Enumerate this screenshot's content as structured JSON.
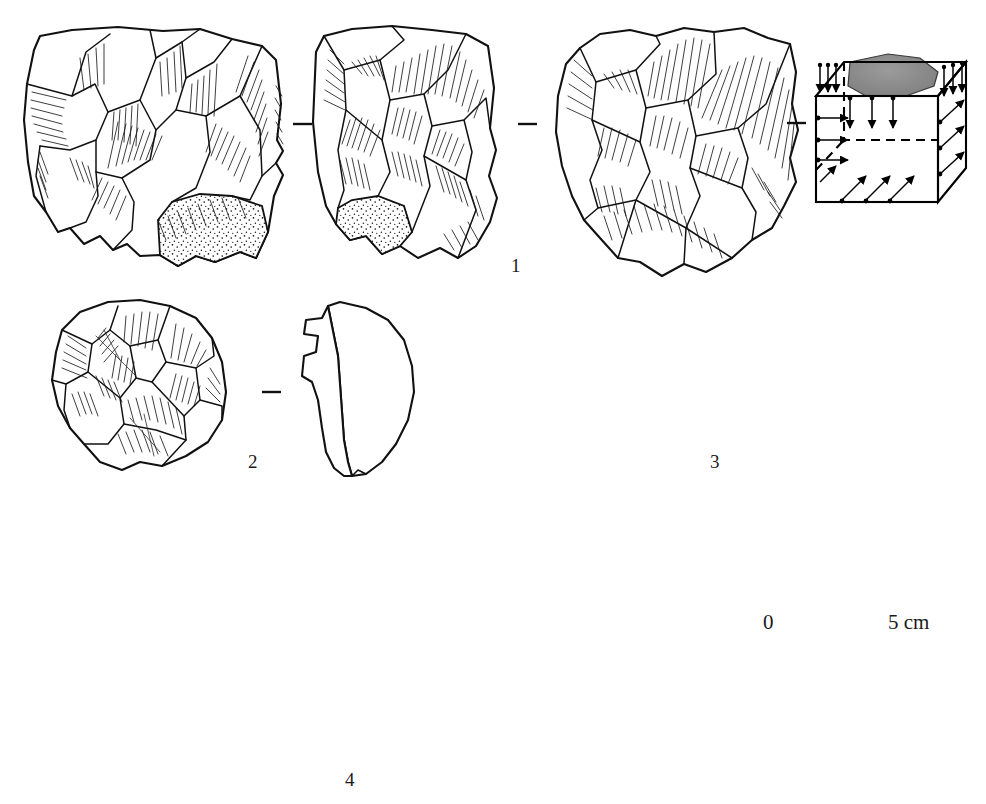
{
  "plate": {
    "kind": "archaeological-lithic-illustration-plate",
    "background_color": "#ffffff",
    "ink_color": "#111111",
    "cortex_fill": "#ffffff",
    "shaded_fill": "#8c8c8c",
    "rows": 3
  },
  "figures": [
    {
      "id": "fig1",
      "label": "1",
      "label_x": 511,
      "label_y": 256,
      "views": [
        {
          "name": "dorsal-face-view",
          "kind": "flint-core-drawing",
          "x": 20,
          "y": 18,
          "w": 275,
          "h": 262,
          "has_cortex": true,
          "cortex_position": "bottom-right"
        },
        {
          "name": "lateral-face-view",
          "kind": "flint-core-drawing",
          "x": 305,
          "y": 22,
          "w": 200,
          "h": 245,
          "has_cortex": true,
          "cortex_position": "bottom-left"
        },
        {
          "name": "ventral-face-view",
          "kind": "flint-core-drawing",
          "x": 556,
          "y": 22,
          "w": 248,
          "h": 258,
          "has_cortex": false,
          "cortex_position": ""
        },
        {
          "name": "schematic-cube-diagram",
          "kind": "cube-scheme",
          "x": 810,
          "y": 48,
          "w": 168,
          "h": 158,
          "shaded_patch": true
        }
      ],
      "separators": [
        {
          "name": "view-separator-dash",
          "x": 293,
          "y": 124,
          "len": 19
        },
        {
          "name": "view-separator-dash",
          "x": 518,
          "y": 124,
          "len": 19
        },
        {
          "name": "view-separator-dash",
          "x": 787,
          "y": 123,
          "len": 19
        }
      ]
    },
    {
      "id": "fig2",
      "label": "2",
      "label_x": 248,
      "label_y": 462,
      "views": [
        {
          "name": "dorsal-face-view",
          "kind": "flint-core-drawing",
          "x": 48,
          "y": 298,
          "w": 200,
          "h": 175,
          "has_cortex": false,
          "cortex_position": ""
        },
        {
          "name": "section-profile-view",
          "kind": "profile-outline",
          "x": 305,
          "y": 300,
          "w": 120,
          "h": 178,
          "has_cortex": false,
          "cortex_position": ""
        }
      ],
      "separators": [
        {
          "name": "view-separator-dash",
          "x": 262,
          "y": 392,
          "len": 19
        }
      ]
    },
    {
      "id": "fig3",
      "label": "3",
      "label_x": 710,
      "label_y": 462,
      "views": [
        {
          "name": "dorsal-face-view",
          "kind": "flint-core-drawing",
          "x": 480,
          "y": 300,
          "w": 190,
          "h": 170,
          "has_cortex": false,
          "cortex_position": ""
        },
        {
          "name": "hatched-section-view",
          "kind": "hatched-section",
          "x": 680,
          "y": 300,
          "w": 70,
          "h": 168,
          "has_cortex": false,
          "cortex_position": ""
        },
        {
          "name": "ventral-cortex-view",
          "kind": "flint-core-drawing",
          "x": 782,
          "y": 298,
          "w": 178,
          "h": 160,
          "has_cortex": true,
          "cortex_position": "full-face"
        }
      ],
      "separators": [
        {
          "name": "view-separator-dash",
          "x": 660,
          "y": 380,
          "len": 19
        },
        {
          "name": "view-separator-dash",
          "x": 762,
          "y": 380,
          "len": 19
        }
      ]
    },
    {
      "id": "fig4",
      "label": "4",
      "label_x": 345,
      "label_y": 773,
      "views": [
        {
          "name": "dorsal-face-view",
          "kind": "flint-core-drawing",
          "x": 48,
          "y": 505,
          "w": 272,
          "h": 262,
          "has_cortex": true,
          "cortex_position": "left"
        },
        {
          "name": "lateral-face-view",
          "kind": "flint-core-drawing",
          "x": 372,
          "y": 500,
          "w": 172,
          "h": 272,
          "has_cortex": true,
          "cortex_position": "right"
        },
        {
          "name": "schematic-cube-diagram",
          "kind": "cube-scheme",
          "x": 562,
          "y": 534,
          "w": 182,
          "h": 166,
          "shaded_patch": false
        }
      ],
      "separators": [
        {
          "name": "view-separator-dash",
          "x": 326,
          "y": 626,
          "len": 19
        },
        {
          "name": "view-separator-dash",
          "x": 536,
          "y": 626,
          "len": 19
        }
      ]
    }
  ],
  "scale": {
    "name": "scale-bar",
    "start_label": "0",
    "end_label": "5 cm",
    "unit": "cm",
    "min": 0,
    "max": 5,
    "divisions": 5,
    "x": 766,
    "y": 652,
    "width": 160,
    "tick_height": 12,
    "start_label_x": 763,
    "start_label_y": 617,
    "end_label_x": 890,
    "end_label_y": 617
  }
}
